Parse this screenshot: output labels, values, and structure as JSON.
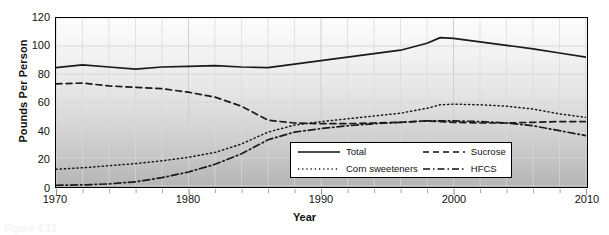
{
  "figure": {
    "caption_fragment": "Figure 4.12"
  },
  "axes": {
    "ylabel": "Pounds Per Person",
    "xlabel": "Year",
    "yticks": [
      "120",
      "100",
      "80",
      "60",
      "40",
      "20",
      "0"
    ],
    "xticks": [
      "1970",
      "1980",
      "1990",
      "2000",
      "2010"
    ]
  },
  "legend": {
    "entries": [
      {
        "label": "Total",
        "style": "solid",
        "sample": "total-line-sample"
      },
      {
        "label": "Sucrose",
        "style": "dashed",
        "sample": "sucrose-line-sample"
      },
      {
        "label": "Corn sweeteners",
        "style": "dotted",
        "sample": "corn-sweeteners-line-sample"
      },
      {
        "label": "HFCS",
        "style": "dashdot",
        "sample": "hfcs-line-sample"
      }
    ]
  },
  "chart_data": {
    "type": "line",
    "title": "",
    "xlabel": "Year",
    "ylabel": "Pounds Per Person",
    "xlim": [
      1970,
      2010
    ],
    "ylim": [
      0,
      120
    ],
    "ytick_step": 20,
    "xtick_step": 10,
    "xminor_step": 2,
    "grid": true,
    "legend_position": "inside-bottom-center",
    "colors": {
      "line": "#1a1a1a",
      "plot_background_top": "#fdfdfd",
      "plot_background_bottom": "#b4b4b4",
      "gridline": "#d8d8d8"
    },
    "x": [
      1970,
      1972,
      1974,
      1976,
      1978,
      1980,
      1982,
      1984,
      1986,
      1988,
      1990,
      1992,
      1994,
      1996,
      1998,
      1999,
      2000,
      2002,
      2004,
      2006,
      2008,
      2010
    ],
    "series": [
      {
        "name": "Total",
        "style": "solid",
        "values": [
          84.5,
          86.5,
          85.0,
          83.5,
          85.0,
          85.5,
          86.0,
          85.0,
          84.5,
          87.0,
          89.5,
          92.0,
          94.5,
          97.0,
          102.0,
          106.0,
          105.5,
          103.0,
          100.5,
          98.0,
          95.0,
          92.0
        ]
      },
      {
        "name": "Sucrose",
        "style": "dashed",
        "values": [
          73.0,
          73.5,
          71.5,
          70.5,
          69.5,
          67.0,
          63.5,
          57.0,
          47.0,
          45.0,
          44.5,
          44.5,
          45.0,
          45.5,
          46.5,
          46.0,
          45.5,
          45.0,
          45.0,
          45.5,
          46.0,
          46.0
        ]
      },
      {
        "name": "Corn sweeteners",
        "style": "dotted",
        "values": [
          12.0,
          13.0,
          14.5,
          16.0,
          18.0,
          20.5,
          24.0,
          30.0,
          38.5,
          43.5,
          46.0,
          48.0,
          50.0,
          52.0,
          55.5,
          58.0,
          58.5,
          58.0,
          57.0,
          55.0,
          51.5,
          49.0
        ]
      },
      {
        "name": "HFCS",
        "style": "dashdot",
        "values": [
          0.5,
          0.8,
          1.5,
          3.0,
          6.0,
          10.0,
          15.5,
          23.0,
          33.0,
          38.5,
          41.0,
          43.0,
          44.5,
          45.5,
          46.5,
          46.5,
          46.5,
          46.0,
          45.0,
          43.0,
          39.5,
          36.0
        ]
      }
    ]
  }
}
